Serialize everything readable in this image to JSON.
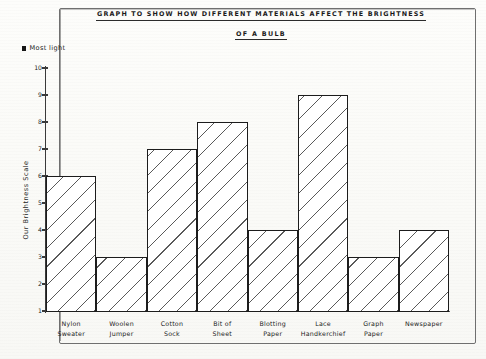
{
  "title": {
    "line1": "GRAPH  TO  SHOW  HOW  DIFFERENT  MATERIALS  AFFECT  THE  BRIGHTNESS",
    "line2": "OF  A  BULB"
  },
  "annotation": {
    "marker_label": "Most light"
  },
  "chart_data": {
    "type": "bar",
    "title": "GRAPH TO SHOW HOW DIFFERENT MATERIALS AFFECT THE BRIGHTNESS OF A BULB",
    "xlabel": "",
    "ylabel": "Our Brightness Scale",
    "ylim": [
      1,
      10
    ],
    "yticks": [
      10,
      9,
      8,
      7,
      6,
      5,
      4,
      3,
      2,
      1
    ],
    "grid": false,
    "legend": false,
    "annotations": [
      "Most light"
    ],
    "categories": [
      "Nylon Sweater",
      "Woolen Jumper",
      "Cotton Sock",
      "Bit of Sheet",
      "Blotting Paper",
      "Lace Handkerchief",
      "Graph Paper",
      "Newspaper"
    ],
    "category_lines": [
      [
        "Nylon",
        "Sweater"
      ],
      [
        "Woolen",
        "Jumper"
      ],
      [
        "Cotton",
        "Sock"
      ],
      [
        "Bit of",
        "Sheet"
      ],
      [
        "Blotting",
        "Paper"
      ],
      [
        "Lace",
        "Handkerchief"
      ],
      [
        "Graph",
        "Paper"
      ],
      [
        "Newspaper",
        ""
      ]
    ],
    "values": [
      6,
      3,
      7,
      8,
      4,
      9,
      3,
      4
    ],
    "bar_style": {
      "fill": "#ffffff",
      "hatch": "diagonal",
      "edge": "#1c1c1c"
    }
  }
}
